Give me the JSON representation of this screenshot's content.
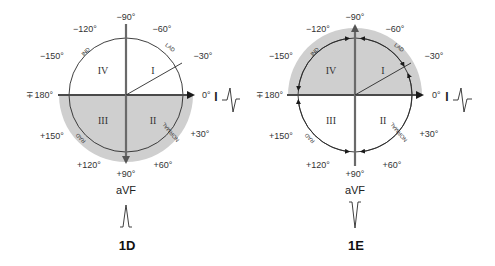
{
  "colors": {
    "shade": "#cfcfcf",
    "axis": "#6a6a6a",
    "line": "#2a2a2a",
    "text": "#333333"
  },
  "panels": [
    {
      "id": "1D",
      "label": "1D",
      "shaded_half": "lower",
      "degrees": {
        "m90": "−90°",
        "m60": "−60°",
        "m30": "−30°",
        "zero": "0°",
        "p30": "+30°",
        "p60": "+60°",
        "p90": "+90°",
        "p120": "+120°",
        "p150": "+150°",
        "pm180": "∓180°",
        "m150": "−150°",
        "m120": "−120°"
      },
      "quadrants": {
        "q1": "I",
        "q2": "II",
        "q3": "III",
        "q4": "IV"
      },
      "arc_labels": {
        "ind": "IND",
        "lad": "LAD",
        "normal": "NORMAL",
        "rad": "RAD"
      },
      "leads": {
        "horizontal": "I",
        "vertical": "aVF"
      },
      "avf_deflection": "positive"
    },
    {
      "id": "1E",
      "label": "1E",
      "shaded_half": "upper",
      "degrees": {
        "m90": "−90°",
        "m60": "−60°",
        "m30": "−30°",
        "zero": "0°",
        "p30": "+30°",
        "p60": "+60°",
        "p90": "+90°",
        "p120": "+120°",
        "p150": "+150°",
        "pm180": "∓180°",
        "m150": "−150°",
        "m120": "−120°"
      },
      "quadrants": {
        "q1": "I",
        "q2": "II",
        "q3": "III",
        "q4": "IV"
      },
      "arc_labels": {
        "ind": "IND",
        "lad": "LAD",
        "normal": "NORMAL",
        "rad": "RAD"
      },
      "leads": {
        "horizontal": "I",
        "vertical": "aVF"
      },
      "avf_deflection": "negative"
    }
  ]
}
